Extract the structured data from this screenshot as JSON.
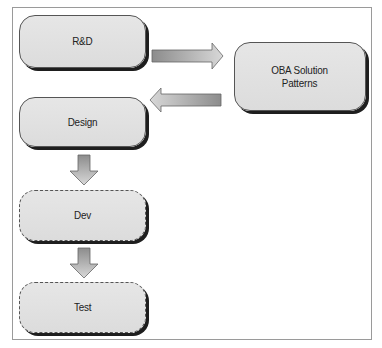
{
  "diagram": {
    "nodes": [
      {
        "id": "rnd",
        "label": "R&D",
        "style": "solid"
      },
      {
        "id": "oba",
        "label": "OBA Solution Patterns",
        "label_lines": [
          "OBA Solution",
          "Patterns"
        ],
        "style": "solid"
      },
      {
        "id": "design",
        "label": "Design",
        "style": "solid"
      },
      {
        "id": "dev",
        "label": "Dev",
        "style": "dashed"
      },
      {
        "id": "test",
        "label": "Test",
        "style": "dashed"
      }
    ],
    "edges": [
      {
        "from": "rnd",
        "to": "oba",
        "direction": "right"
      },
      {
        "from": "oba",
        "to": "design",
        "direction": "left"
      },
      {
        "from": "design",
        "to": "dev",
        "direction": "down"
      },
      {
        "from": "dev",
        "to": "test",
        "direction": "down"
      }
    ],
    "colors": {
      "box_fill": "#e0e0e0",
      "box_border": "#555555",
      "box_shadow": "#1e1e1e",
      "arrow_fill_dark": "#8c8c8c",
      "arrow_fill_light": "#d4d4d4",
      "frame_border": "#9a9a9a"
    }
  }
}
